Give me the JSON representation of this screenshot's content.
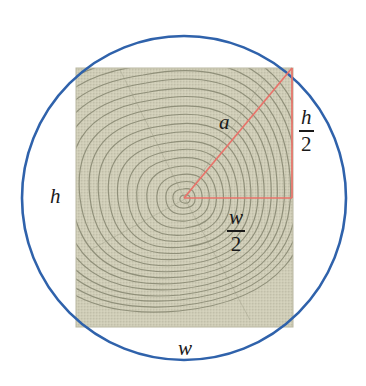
{
  "figure": {
    "background_color": "#ffffff",
    "circle": {
      "name": "log-cross-section",
      "center_x": 184,
      "center_y": 198,
      "radius": 162,
      "stroke_color": "#2f62ab",
      "stroke_width": 2.6,
      "fill": "none"
    },
    "rectangle": {
      "name": "beam-cross-section",
      "x": 76,
      "y": 68,
      "width": 217,
      "height": 259,
      "fill_color": "#cfcdb7",
      "grain_color": "#8f8f79",
      "grain_center_x": 185,
      "grain_center_y": 199,
      "ring_count": 19
    },
    "triangle": {
      "name": "right-triangle-construction",
      "stroke_color": "#e8736a",
      "stroke_width": 1.6,
      "vertex_center": [
        184,
        198
      ],
      "vertex_corner": [
        292,
        68
      ],
      "vertex_right_angle": [
        292,
        198
      ]
    }
  },
  "labels": {
    "hypotenuse": "a",
    "height": "h",
    "width": "w",
    "half_height_numerator": "h",
    "half_height_denominator": "2",
    "half_width_numerator": "w",
    "half_width_denominator": "2"
  },
  "colors": {
    "circle_blue": "#2f62ab",
    "triangle_red": "#e8736a",
    "wood_beige": "#cfcdb7",
    "wood_grain": "#8f8f79",
    "text_black": "#1a1a1a",
    "page_white": "#ffffff"
  }
}
